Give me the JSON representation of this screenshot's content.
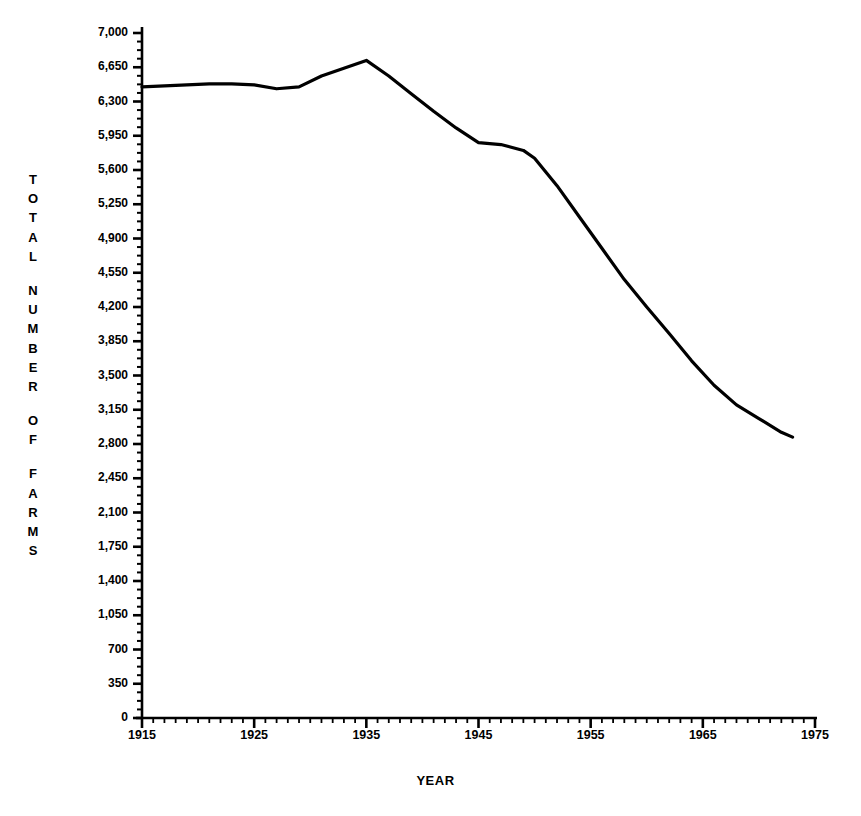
{
  "chart_data": {
    "type": "line",
    "title": "",
    "xlabel": "YEAR",
    "ylabel": "TOTAL NUMBER OF FARMS",
    "ylabel_letters": [
      "T",
      "O",
      "T",
      "A",
      "L",
      "",
      "N",
      "U",
      "M",
      "B",
      "E",
      "R",
      "",
      "O",
      "F",
      "",
      "F",
      "A",
      "R",
      "M",
      "S"
    ],
    "xlim": [
      1915,
      1975
    ],
    "ylim": [
      0,
      7000
    ],
    "grid": false,
    "legend": null,
    "y_ticks": [
      0,
      350,
      700,
      1050,
      1400,
      1750,
      2100,
      2450,
      2800,
      3150,
      3500,
      3850,
      4200,
      4550,
      4900,
      5250,
      5600,
      5950,
      6300,
      6650,
      7000
    ],
    "y_tick_labels": [
      "0",
      "350",
      "700",
      "1,050",
      "1,400",
      "1,750",
      "2,100",
      "2,450",
      "2,800",
      "3,150",
      "3,500",
      "3,850",
      "4,200",
      "4,550",
      "4,900",
      "5,250",
      "5,600",
      "5,950",
      "6,300",
      "6,650",
      "7,000"
    ],
    "x_ticks": [
      1915,
      1925,
      1935,
      1945,
      1955,
      1965,
      1975
    ],
    "x_tick_labels": [
      "1915",
      "1925",
      "1935",
      "1945",
      "1955",
      "1965",
      "1975"
    ],
    "x_minor_tick_interval": 1,
    "y_minor_tick_interval": 87.5,
    "line_color": "#000000",
    "line_width_px": 3.2,
    "axis_color": "#000000",
    "series": [
      {
        "name": "Total number of farms",
        "x": [
          1915,
          1917,
          1919,
          1921,
          1923,
          1925,
          1927,
          1929,
          1931,
          1933,
          1935,
          1937,
          1939,
          1941,
          1943,
          1945,
          1947,
          1949,
          1950,
          1952,
          1954,
          1956,
          1958,
          1960,
          1962,
          1964,
          1966,
          1968,
          1970,
          1972,
          1973
        ],
        "y": [
          6450,
          6460,
          6470,
          6480,
          6480,
          6470,
          6430,
          6450,
          6560,
          6640,
          6720,
          6560,
          6380,
          6200,
          6030,
          5880,
          5860,
          5800,
          5720,
          5440,
          5120,
          4800,
          4480,
          4200,
          3930,
          3650,
          3400,
          3200,
          3060,
          2920,
          2870
        ]
      }
    ]
  },
  "axes": {
    "y_axis_label_text": "TOTAL NUMBER OF FARMS",
    "x_axis_label_text": "YEAR"
  }
}
